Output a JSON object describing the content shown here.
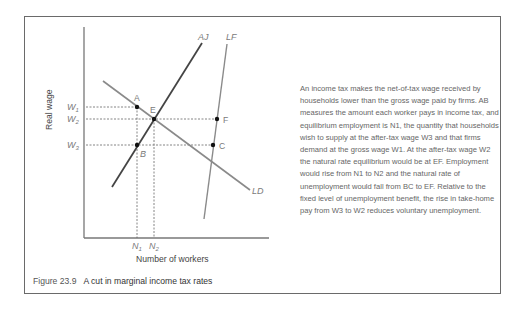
{
  "figure": {
    "number": "Figure 23.9",
    "title": "A cut in marginal income tax rates"
  },
  "axes": {
    "xlabel": "Number of workers",
    "ylabel": "Real wage"
  },
  "curves": {
    "aj": "AJ",
    "lf": "LF",
    "ld": "LD"
  },
  "y_ticks": {
    "w1": "W",
    "w1_sub": "1",
    "w2": "W",
    "w2_sub": "2",
    "w3": "W",
    "w3_sub": "3"
  },
  "x_ticks": {
    "n1": "N",
    "n1_sub": "1",
    "n2": "N",
    "n2_sub": "2"
  },
  "points": {
    "a": "A",
    "b": "B",
    "c": "C",
    "e": "E",
    "f": "F"
  },
  "description": "An income tax makes the net-of-tax wage received by households lower than the gross wage paid by firms. AB measures the amount each worker pays in income tax, and equilibrium employment is N1, the quantity that households wish to supply at the after-tax wage W3 and that firms demand at the gross wage W1. At the after-tax wage W2 the natural rate equilibrium would be at EF. Employment would rise from N1 to N2 and the natural rate of unemployment would fall from BC to EF. Relative to the fixed level of unemployment benefit, the rise in take-home pay from W3 to W2 reduces voluntary unemployment.",
  "colors": {
    "frame": "#6a6a6a",
    "aj_line": "#444444",
    "ld_line": "#8a8a8a",
    "lf_line": "#8a8a8a",
    "axis": "#777777",
    "dashed": "#666666",
    "point": "#111111"
  }
}
